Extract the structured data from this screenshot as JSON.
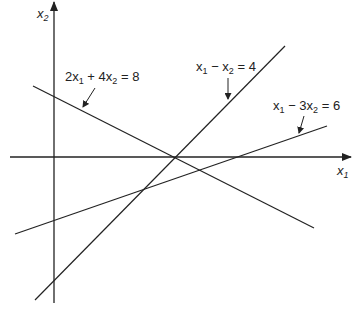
{
  "diagram": {
    "type": "linear-constraints-plot",
    "axes": {
      "x_label": {
        "base": "x",
        "sub": "1"
      },
      "y_label": {
        "base": "x",
        "sub": "2"
      }
    },
    "lines": [
      {
        "id": "line-a",
        "equation": "2x1 + 4x2 = 8",
        "label_parts": [
          {
            "t": "2x",
            "s": "1"
          },
          {
            "t": " + 4x",
            "s": "2"
          },
          {
            "t": " = 8",
            "s": ""
          }
        ]
      },
      {
        "id": "line-b",
        "equation": "x1 − x2 = 4",
        "label_parts": [
          {
            "t": "x",
            "s": "1"
          },
          {
            "t": " − x",
            "s": "2"
          },
          {
            "t": " = 4",
            "s": ""
          }
        ]
      },
      {
        "id": "line-c",
        "equation": "x1 − 3x2 = 6",
        "label_parts": [
          {
            "t": "x",
            "s": "1"
          },
          {
            "t": " − 3x",
            "s": "2"
          },
          {
            "t": " = 6",
            "s": ""
          }
        ]
      }
    ],
    "colors": {
      "stroke": "#222222",
      "background": "#ffffff"
    }
  }
}
